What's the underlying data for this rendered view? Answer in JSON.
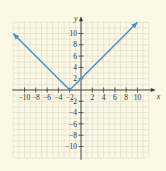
{
  "chart_data": {
    "type": "line",
    "title": "",
    "function": "y = |x + 2|",
    "xlabel": "x",
    "ylabel": "y",
    "xlim": [
      -12,
      12
    ],
    "ylim": [
      -12,
      12
    ],
    "grid": true,
    "x_ticks": [
      -10,
      -8,
      -6,
      -4,
      -2,
      2,
      4,
      6,
      8,
      10
    ],
    "y_ticks": [
      10,
      8,
      6,
      4,
      2,
      -2,
      -4,
      -6,
      -8,
      -10
    ],
    "series": [
      {
        "name": "y = |x + 2|",
        "color": "#4a90c8",
        "points": [
          [
            -12,
            10
          ],
          [
            -2,
            0
          ],
          [
            10,
            12
          ]
        ],
        "arrows": "both-ends"
      }
    ],
    "annotations": [
      {
        "label": "vertex",
        "x": -2,
        "y": 0
      },
      {
        "label": "y-intercept",
        "x": 0,
        "y": 2
      }
    ]
  },
  "labels": {
    "x_axis": "x",
    "y_axis": "y",
    "x_tick_labels": [
      "−10",
      "−8",
      "−6",
      "−4",
      "−2",
      "2",
      "4",
      "6",
      "8",
      "10"
    ],
    "y_tick_labels": [
      "10",
      "8",
      "6",
      "4",
      "2",
      "−2",
      "−4",
      "−6",
      "−8",
      "−10"
    ]
  },
  "colors": {
    "background": "#fbf8e6",
    "grid": "#ddd9c4",
    "axis": "#3a3a3a",
    "line": "#4a90c8"
  }
}
